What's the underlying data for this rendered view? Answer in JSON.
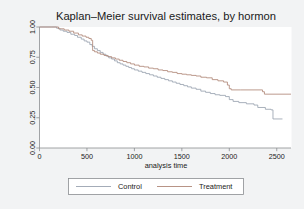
{
  "chart_data": {
    "type": "line",
    "title": "Kaplan–Meier survival estimates, by hormon",
    "xlabel": "analysis time",
    "ylabel": "",
    "xlim": [
      0,
      2650
    ],
    "ylim": [
      0,
      1
    ],
    "grid": false,
    "legend_position": "bottom",
    "xticks": [
      0,
      500,
      1000,
      1500,
      2000,
      2500
    ],
    "xtick_labels": [
      "0",
      "500",
      "1000",
      "1500",
      "2000",
      "2500"
    ],
    "yticks": [
      0.0,
      0.25,
      0.5,
      0.75,
      1.0
    ],
    "ytick_labels": [
      "0.00",
      "0.25",
      "0.50",
      "0.75",
      "1.00"
    ],
    "series": [
      {
        "name": "Control",
        "color": "#9aa3b0",
        "step": "post",
        "x": [
          0,
          120,
          180,
          215,
          250,
          290,
          330,
          370,
          400,
          440,
          470,
          500,
          530,
          555,
          580,
          610,
          640,
          670,
          700,
          730,
          760,
          790,
          820,
          850,
          880,
          910,
          940,
          970,
          1000,
          1040,
          1080,
          1120,
          1160,
          1200,
          1240,
          1280,
          1320,
          1360,
          1400,
          1440,
          1480,
          1520,
          1560,
          1600,
          1650,
          1700,
          1750,
          1800,
          1850,
          1900,
          1960,
          2000,
          2040,
          2100,
          2180,
          2260,
          2300,
          2380,
          2440,
          2460,
          2560
        ],
        "y": [
          1.0,
          1.0,
          0.99,
          0.975,
          0.965,
          0.955,
          0.94,
          0.93,
          0.915,
          0.9,
          0.885,
          0.875,
          0.855,
          0.84,
          0.82,
          0.805,
          0.79,
          0.775,
          0.76,
          0.745,
          0.735,
          0.72,
          0.705,
          0.695,
          0.685,
          0.675,
          0.665,
          0.655,
          0.645,
          0.635,
          0.625,
          0.615,
          0.605,
          0.595,
          0.585,
          0.575,
          0.565,
          0.555,
          0.545,
          0.535,
          0.525,
          0.515,
          0.505,
          0.495,
          0.485,
          0.47,
          0.46,
          0.45,
          0.44,
          0.435,
          0.425,
          0.4,
          0.385,
          0.375,
          0.365,
          0.355,
          0.335,
          0.32,
          0.315,
          0.24,
          0.24
        ]
      },
      {
        "name": "Treatment",
        "color": "#b08878",
        "step": "post",
        "x": [
          0,
          130,
          200,
          260,
          310,
          360,
          410,
          450,
          490,
          520,
          545,
          560,
          580,
          610,
          640,
          680,
          720,
          760,
          800,
          840,
          880,
          920,
          960,
          1000,
          1050,
          1100,
          1150,
          1200,
          1250,
          1300,
          1350,
          1400,
          1450,
          1500,
          1550,
          1600,
          1650,
          1700,
          1760,
          1820,
          1880,
          1940,
          1980,
          2000,
          2020,
          2120,
          2250,
          2350,
          2370,
          2650
        ],
        "y": [
          1.0,
          1.0,
          0.985,
          0.975,
          0.965,
          0.95,
          0.935,
          0.925,
          0.915,
          0.905,
          0.89,
          0.805,
          0.795,
          0.785,
          0.775,
          0.765,
          0.755,
          0.745,
          0.735,
          0.725,
          0.715,
          0.705,
          0.695,
          0.685,
          0.675,
          0.67,
          0.66,
          0.655,
          0.645,
          0.64,
          0.63,
          0.625,
          0.615,
          0.61,
          0.605,
          0.6,
          0.595,
          0.585,
          0.58,
          0.565,
          0.555,
          0.545,
          0.52,
          0.49,
          0.48,
          0.48,
          0.48,
          0.465,
          0.445,
          0.445
        ]
      }
    ]
  },
  "legend": {
    "entries": [
      {
        "label": "Control",
        "color": "#9aa3b0"
      },
      {
        "label": "Treatment",
        "color": "#b08878"
      }
    ]
  },
  "style": {
    "figure_bg": "#f2f3f4",
    "plot_bg": "#ffffff",
    "axis_color": "#8a8d91",
    "text_color": "#1a1a1a"
  }
}
